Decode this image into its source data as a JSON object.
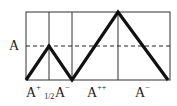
{
  "diagram": {
    "y_label": "A",
    "segments": [
      {
        "base": "A",
        "sup": "+",
        "sub": "1/2"
      },
      {
        "base": "A",
        "sup": "−"
      },
      {
        "base": "A",
        "sup": "++"
      },
      {
        "base": "A",
        "sup": "−"
      }
    ],
    "box": {
      "x0": 26,
      "x1": 170,
      "y0": 12,
      "y1": 80
    },
    "dividers_x": [
      49,
      72,
      118
    ],
    "dashed_level_y": 46,
    "path_points": [
      [
        26,
        80
      ],
      [
        49,
        46
      ],
      [
        72,
        80
      ],
      [
        118,
        12
      ],
      [
        168,
        80
      ]
    ],
    "colors": {
      "line": "#111111",
      "grid": "#333333"
    }
  }
}
